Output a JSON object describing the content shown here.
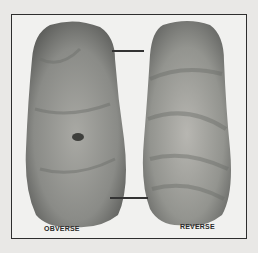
{
  "figure": {
    "labels": {
      "left": "OBVERSE",
      "right": "REVERSE"
    },
    "colors": {
      "background": "#e9e8e6",
      "panel": "#f1f1ef",
      "border": "#2e2e2e",
      "stone_dark": "#6b6c69",
      "stone_mid": "#8e8f8b",
      "stone_light": "#b3b3ae"
    }
  }
}
